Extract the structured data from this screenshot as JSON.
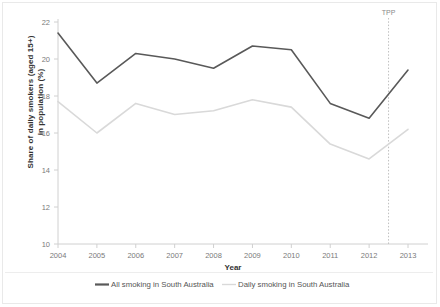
{
  "chart_data": {
    "type": "line",
    "title": "",
    "xlabel": "Year",
    "ylabel": "Share of daily smokers (aged 15+) in population (%)",
    "categories": [
      2004,
      2005,
      2006,
      2007,
      2008,
      2009,
      2010,
      2011,
      2012,
      2013
    ],
    "xtick_labels": [
      "2004",
      "2005",
      "2006",
      "2007",
      "2008",
      "2009",
      "2010",
      "2011",
      "2012",
      "2013"
    ],
    "ytick_labels": [
      "10",
      "12",
      "14",
      "16",
      "18",
      "20",
      "22"
    ],
    "yticks": [
      10,
      12,
      14,
      16,
      18,
      20,
      22
    ],
    "ylim": [
      10,
      22
    ],
    "xlim": [
      2004,
      2013
    ],
    "grid": false,
    "legend_position": "bottom",
    "series": [
      {
        "name": "All smoking in South Australia",
        "color": "#595959",
        "values": [
          21.4,
          18.7,
          20.3,
          20.0,
          19.5,
          20.7,
          20.5,
          17.6,
          16.8,
          19.4
        ]
      },
      {
        "name": "Daily smoking in South Australia",
        "color": "#d9d9d9",
        "values": [
          17.7,
          16.0,
          17.6,
          17.0,
          17.2,
          17.8,
          17.4,
          15.4,
          14.6,
          16.2
        ]
      }
    ],
    "annotations": [
      {
        "label": "TPP",
        "x": 2012.5,
        "type": "vertical-dotted-line",
        "color": "#bfbfbf"
      }
    ]
  },
  "axes": {
    "y_title": "Share of daily smokers (aged 15+)",
    "y_title_line2": "in population (%)",
    "x_title": "Year"
  },
  "legend": {
    "items": [
      {
        "label": "All smoking in South Australia",
        "color": "#595959"
      },
      {
        "label": "Daily smoking in South Australia",
        "color": "#d9d9d9"
      }
    ]
  }
}
